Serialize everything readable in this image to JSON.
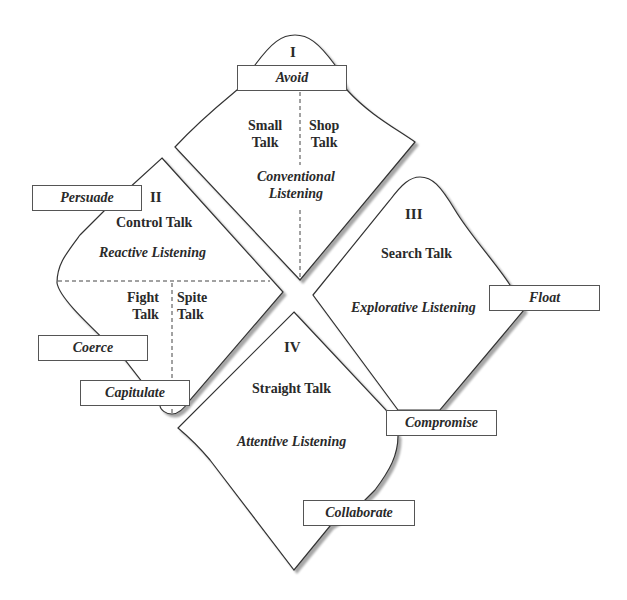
{
  "quadrants": [
    {
      "numeral": "I",
      "talk": [
        "Small\nTalk",
        "Shop\nTalk"
      ],
      "listening": "Conventional\nListening",
      "strategy": "Avoid"
    },
    {
      "numeral": "II",
      "talk_main": "Control Talk",
      "listening": "Reactive Listening",
      "talk": [
        "Fight\nTalk",
        "Spite\nTalk"
      ],
      "strategies": [
        "Persuade",
        "Coerce",
        "Capitulate"
      ]
    },
    {
      "numeral": "III",
      "talk_main": "Search Talk",
      "listening": "Explorative Listening",
      "strategies": [
        "Float",
        "Compromise"
      ]
    },
    {
      "numeral": "IV",
      "talk_main": "Straight Talk",
      "listening": "Attentive Listening",
      "strategies": [
        "Collaborate"
      ]
    }
  ],
  "colors": {
    "stroke": "#333333",
    "shadow": "#b8b8b8",
    "box_border": "#555555",
    "text": "#2a2a2a"
  }
}
